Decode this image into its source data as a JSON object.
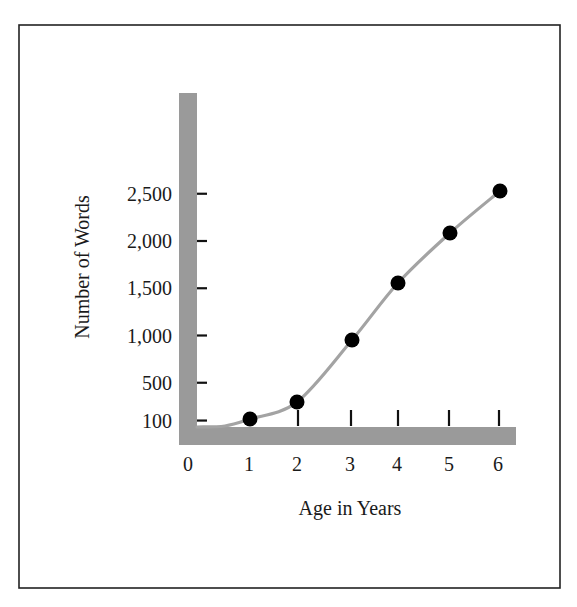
{
  "chart_data": {
    "type": "line",
    "title": "",
    "xlabel": "Age in Years",
    "ylabel": "Number of Words",
    "x": [
      1,
      2,
      3,
      4,
      5,
      6
    ],
    "values": [
      100,
      300,
      950,
      1550,
      2100,
      2550
    ],
    "series": [
      {
        "name": "Vocabulary size",
        "x": [
          1,
          2,
          3,
          4,
          5,
          6
        ],
        "values": [
          100,
          300,
          950,
          1550,
          2100,
          2550
        ]
      }
    ],
    "x_tick_labels": [
      "0",
      "1",
      "2",
      "3",
      "4",
      "5",
      "6"
    ],
    "y_tick_labels": [
      "100",
      "500",
      "1,000",
      "1,500",
      "2,000",
      "2,500"
    ],
    "y_tick_values": [
      100,
      500,
      1000,
      1500,
      2000,
      2500
    ],
    "xlim": [
      0,
      6
    ],
    "ylim": [
      0,
      2800
    ],
    "grid": false,
    "legend": "none",
    "smooth_curve": true
  },
  "colors": {
    "axis_bar": "#9a9a9a",
    "curve": "#a3a3a3",
    "marker": "#000000",
    "text": "#1a1a1a",
    "frame": "#222222"
  }
}
